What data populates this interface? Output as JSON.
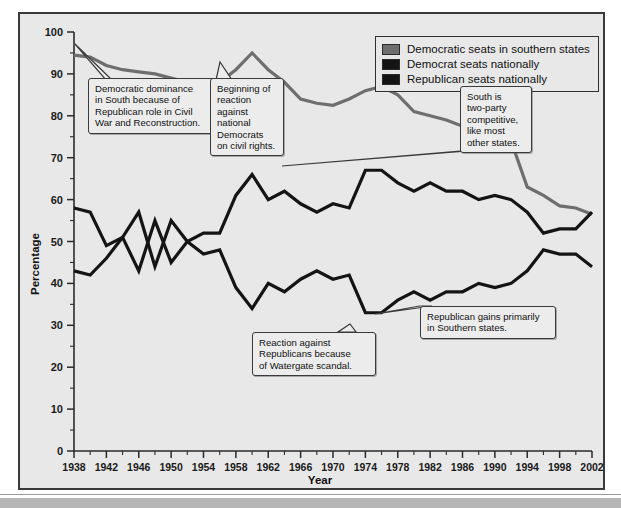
{
  "chart_data": {
    "type": "line",
    "title": "",
    "xlabel": "Year",
    "ylabel": "Percentage",
    "xlim": [
      1938,
      2002
    ],
    "ylim": [
      0,
      100
    ],
    "grid": false,
    "legend_position": "top-right",
    "x": [
      1938,
      1940,
      1942,
      1944,
      1946,
      1948,
      1950,
      1952,
      1954,
      1956,
      1958,
      1960,
      1962,
      1964,
      1966,
      1968,
      1970,
      1972,
      1974,
      1976,
      1978,
      1980,
      1982,
      1984,
      1986,
      1988,
      1990,
      1992,
      1994,
      1996,
      1998,
      2000,
      2002
    ],
    "xticks": [
      1938,
      1942,
      1946,
      1950,
      1954,
      1958,
      1962,
      1966,
      1970,
      1974,
      1978,
      1982,
      1986,
      1990,
      1994,
      1998,
      2002
    ],
    "yticks": [
      0,
      10,
      20,
      30,
      40,
      50,
      60,
      70,
      80,
      90,
      100
    ],
    "series": [
      {
        "name": "Democratic seats in southern states",
        "color": "#6e6e6e",
        "values": [
          94.5,
          94,
          92,
          91,
          90.5,
          90,
          89,
          88,
          87.5,
          88,
          91,
          95,
          91,
          88,
          84,
          83,
          82.5,
          84,
          86,
          87,
          85,
          81,
          80,
          79,
          77.5,
          77.5,
          76,
          74,
          63,
          61,
          58.5,
          58,
          56.5
        ]
      },
      {
        "name": "Democrat seats nationally",
        "color": "#141414",
        "values": [
          58,
          57,
          49,
          51,
          43,
          55,
          45,
          50,
          52,
          52,
          61,
          66,
          60,
          62,
          59,
          57,
          59,
          58,
          67,
          67,
          64,
          62,
          64,
          62,
          62,
          60,
          61,
          60,
          57,
          52,
          53,
          53,
          57
        ]
      },
      {
        "name": "Republican seats nationally",
        "color": "#141414",
        "values": [
          43,
          42,
          46,
          51,
          57,
          44,
          55,
          50,
          47,
          48,
          39,
          34,
          40,
          38,
          41,
          43,
          41,
          42,
          33,
          33,
          36,
          38,
          36,
          38,
          38,
          40,
          39,
          40,
          43,
          48,
          47,
          47,
          44
        ]
      }
    ],
    "legend": [
      {
        "label": "Democratic seats in southern states",
        "color": "#6e6e6e"
      },
      {
        "label": "Democrat seats nationally",
        "color": "#141414"
      },
      {
        "label": "Republican seats nationally",
        "color": "#141414"
      }
    ],
    "annotations": [
      {
        "id": "callout-democratic-dominance",
        "text": "Democratic dominance\nin South because of\nRepublican role in Civil\nWar and Reconstruction."
      },
      {
        "id": "callout-civil-rights-reaction",
        "text": "Beginning of\nreaction\nagainst\nnational\nDemocrats\non civil rights."
      },
      {
        "id": "callout-two-party-south",
        "text": "South is\ntwo-party\ncompetitive,\nlike most\nother states."
      },
      {
        "id": "callout-watergate",
        "text": "Reaction against\nRepublicans because\nof Watergate scandal."
      },
      {
        "id": "callout-republican-gains",
        "text": "Republican gains primarily\nin Southern states."
      }
    ]
  }
}
